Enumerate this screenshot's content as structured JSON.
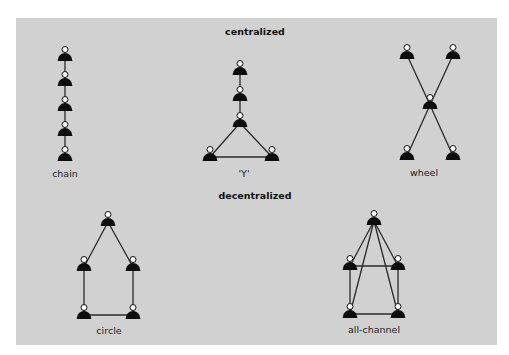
{
  "titles": {
    "centralized": "centralized",
    "decentralized": "decentralized"
  },
  "networks": {
    "chain": {
      "label": "chain",
      "nodes": [
        [
          65,
          57
        ],
        [
          65,
          82
        ],
        [
          65,
          107
        ],
        [
          65,
          132
        ],
        [
          65,
          157
        ]
      ],
      "edges": [
        [
          0,
          1
        ],
        [
          1,
          2
        ],
        [
          2,
          3
        ],
        [
          3,
          4
        ]
      ]
    },
    "y": {
      "label": "'Y'",
      "nodes": [
        [
          240,
          71
        ],
        [
          240,
          97
        ],
        [
          240,
          123
        ],
        [
          210,
          157
        ],
        [
          272,
          157
        ]
      ],
      "edges": [
        [
          0,
          1
        ],
        [
          1,
          2
        ],
        [
          2,
          3
        ],
        [
          2,
          4
        ],
        [
          3,
          4
        ]
      ]
    },
    "wheel": {
      "label": "wheel",
      "nodes": [
        [
          407,
          55
        ],
        [
          453,
          55
        ],
        [
          430,
          105
        ],
        [
          407,
          156
        ],
        [
          453,
          156
        ]
      ],
      "edges": [
        [
          0,
          2
        ],
        [
          1,
          2
        ],
        [
          2,
          3
        ],
        [
          2,
          4
        ]
      ]
    },
    "circle": {
      "label": "circle",
      "nodes": [
        [
          108,
          222
        ],
        [
          84,
          267
        ],
        [
          133,
          267
        ],
        [
          84,
          315
        ],
        [
          133,
          315
        ]
      ],
      "edges": [
        [
          0,
          1
        ],
        [
          0,
          2
        ],
        [
          1,
          3
        ],
        [
          2,
          4
        ],
        [
          3,
          4
        ]
      ]
    },
    "all_channel": {
      "label": "all-channel",
      "nodes": [
        [
          374,
          221
        ],
        [
          350,
          266
        ],
        [
          398,
          266
        ],
        [
          350,
          314
        ],
        [
          398,
          314
        ]
      ],
      "edges": [
        [
          0,
          1
        ],
        [
          0,
          2
        ],
        [
          0,
          3
        ],
        [
          0,
          4
        ],
        [
          1,
          2
        ],
        [
          1,
          3
        ],
        [
          2,
          4
        ],
        [
          3,
          4
        ]
      ]
    }
  },
  "colors": {
    "panel": "#d1d1d1",
    "figure": "#0d0d0d",
    "head_fill": "#ffffff",
    "edge": "#2a2a2a"
  }
}
